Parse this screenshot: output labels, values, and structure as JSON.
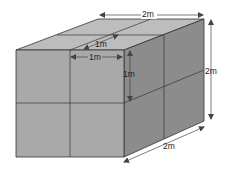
{
  "diagram": {
    "type": "cuboid-of-unit-cubes",
    "labels": {
      "top_width": "2m",
      "right_height": "2m",
      "bottom_depth": "2m",
      "unit_depth": "1m",
      "unit_width": "1m",
      "unit_height": "1m"
    },
    "colors": {
      "front": "#a9a9a9",
      "top": "#bdbdbd",
      "right": "#8c8c8c",
      "edge": "#333333",
      "arrow": "#444444"
    }
  }
}
